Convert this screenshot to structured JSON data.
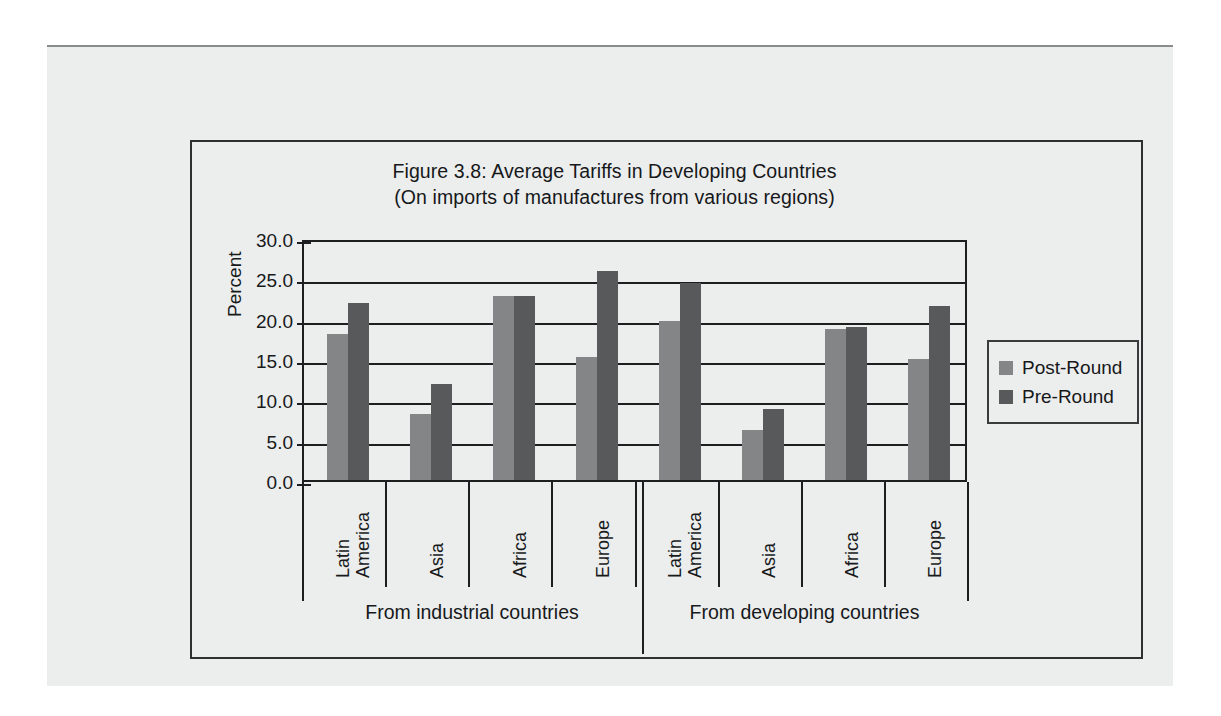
{
  "figure": {
    "title_line1": "Figure 3.8: Average Tariffs in Developing Countries",
    "title_line2": "(On imports of manufactures from various regions)"
  },
  "legend": {
    "position": "right",
    "items": [
      {
        "label": "Post-Round",
        "color": "#848586"
      },
      {
        "label": "Pre-Round",
        "color": "#58595b"
      }
    ]
  },
  "axis": {
    "ylabel": "Percent",
    "yticks": [
      "0.0",
      "5.0",
      "10.0",
      "15.0",
      "20.0",
      "25.0",
      "30.0"
    ]
  },
  "groups": [
    {
      "label": "From industrial countries"
    },
    {
      "label": "From developing countries"
    }
  ],
  "categories": [
    {
      "line1": "Latin",
      "line2": "America"
    },
    {
      "line1": "Asia",
      "line2": ""
    },
    {
      "line1": "Africa",
      "line2": ""
    },
    {
      "line1": "Europe",
      "line2": ""
    }
  ],
  "chart_data": {
    "type": "bar",
    "title": "Figure 3.8: Average Tariffs in Developing Countries",
    "subtitle": "(On imports of manufactures from various regions)",
    "xlabel": "",
    "ylabel": "Percent",
    "ylim": [
      0,
      30
    ],
    "ytick_step": 5,
    "grid": true,
    "legend_position": "right",
    "group_labels": [
      "From industrial countries",
      "From developing countries"
    ],
    "categories": [
      "Latin America (industrial)",
      "Asia (industrial)",
      "Africa (industrial)",
      "Europe (industrial)",
      "Latin America (developing)",
      "Asia (developing)",
      "Africa (developing)",
      "Europe (developing)"
    ],
    "series": [
      {
        "name": "Post-Round",
        "color": "#848586",
        "values": [
          18.3,
          8.4,
          23.1,
          15.5,
          20.0,
          6.5,
          19.0,
          15.3
        ]
      },
      {
        "name": "Pre-Round",
        "color": "#58595b",
        "values": [
          22.2,
          12.2,
          23.0,
          26.2,
          24.7,
          9.0,
          19.2,
          21.8
        ]
      }
    ]
  }
}
